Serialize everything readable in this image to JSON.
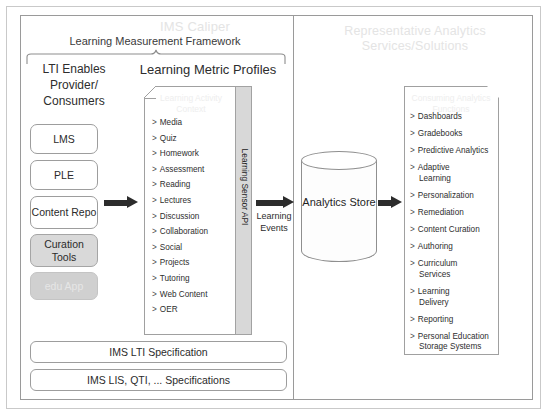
{
  "diagram": {
    "title_watermark": "IMS Caliper",
    "framework_label": "Learning Measurement Framework",
    "analytics_panel_title": "Representative Analytics Services/Solutions"
  },
  "left_panel": {
    "lti_label": "LTI Enables Provider/ Consumers",
    "metric_profiles_label": "Learning Metric Profiles",
    "providers": [
      {
        "label": "LMS",
        "style": "outline"
      },
      {
        "label": "PLE",
        "style": "outline"
      },
      {
        "label": "Content Repo",
        "style": "outline"
      },
      {
        "label": "Curation Tools",
        "style": "filled"
      },
      {
        "label": "edu App",
        "style": "ghost"
      }
    ],
    "metric_doc_title": "Learning Activity Context",
    "metric_profiles": [
      "Media",
      "Quiz",
      "Homework",
      "Assessment",
      "Reading",
      "Lectures",
      "Discussion",
      "Collaboration",
      "Social",
      "Projects",
      "Tutoring",
      "Web Content",
      "OER"
    ],
    "sensor_api_label": "Learning Sensor API",
    "spec_bars": [
      "IMS LTI Specification",
      "IMS LIS, QTI, ... Specifications"
    ]
  },
  "flow": {
    "learning_events_label": "Learning Events",
    "analytics_store_label": "Analytics Store"
  },
  "right_panel": {
    "analytics_doc_title": "Consuming Analytics Functions",
    "services": [
      {
        "label": "Dashboards",
        "sub": ""
      },
      {
        "label": "Gradebooks",
        "sub": ""
      },
      {
        "label": "Predictive Analytics",
        "sub": ""
      },
      {
        "label": "Adaptive",
        "sub": "Learning"
      },
      {
        "label": "Personalization",
        "sub": ""
      },
      {
        "label": "Remediation",
        "sub": ""
      },
      {
        "label": "Content Curation",
        "sub": ""
      },
      {
        "label": "Authoring",
        "sub": ""
      },
      {
        "label": "Curriculum",
        "sub": "Services"
      },
      {
        "label": "Learning",
        "sub": "Delivery"
      },
      {
        "label": "Reporting",
        "sub": ""
      },
      {
        "label": "Personal Education",
        "sub": "Storage Systems"
      }
    ]
  },
  "bullet_glyph": ">",
  "colors": {
    "frame": "#9a9a9a",
    "watermark": "#e4e4e4",
    "arrow": "#2c2c2c",
    "sensor_bar": "#d8d8d8"
  }
}
